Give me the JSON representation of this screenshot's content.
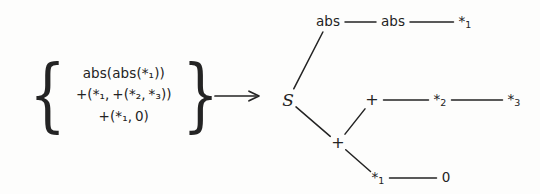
{
  "figure": {
    "background_color": "#fdfdfc",
    "ink_color": "#232323",
    "transform_arrow": "⟶"
  },
  "expression_set": {
    "open_brace": "{",
    "close_brace": "}",
    "lines": [
      {
        "id": "expr-1",
        "text": "abs(abs(*₁))"
      },
      {
        "id": "expr-2",
        "text": "+(*₁, +(*₂, *₃))"
      },
      {
        "id": "expr-3",
        "text": "+(*₁, 0)"
      }
    ]
  },
  "graph": {
    "label": "shared-subexpression-dag",
    "nodes": [
      {
        "id": "abs-top",
        "label": "abs",
        "sub": "",
        "x": 60,
        "y": 22,
        "kind": "function"
      },
      {
        "id": "abs-mid",
        "label": "abs",
        "sub": "",
        "x": 125,
        "y": 22,
        "kind": "function"
      },
      {
        "id": "star1-top",
        "label": "*",
        "sub": "1",
        "x": 197,
        "y": 22,
        "kind": "terminal"
      },
      {
        "id": "root-s",
        "label": "S",
        "sub": "",
        "x": 20,
        "y": 100,
        "kind": "root"
      },
      {
        "id": "plus-mid",
        "label": "+",
        "sub": "",
        "x": 104,
        "y": 100,
        "kind": "operator"
      },
      {
        "id": "star2",
        "label": "*",
        "sub": "2",
        "x": 172,
        "y": 100,
        "kind": "terminal"
      },
      {
        "id": "star3",
        "label": "*",
        "sub": "3",
        "x": 246,
        "y": 100,
        "kind": "terminal"
      },
      {
        "id": "plus-low",
        "label": "+",
        "sub": "",
        "x": 70,
        "y": 143,
        "kind": "operator"
      },
      {
        "id": "star1-low",
        "label": "*",
        "sub": "1",
        "x": 110,
        "y": 178,
        "kind": "terminal"
      },
      {
        "id": "zero",
        "label": "0",
        "sub": "",
        "x": 178,
        "y": 178,
        "kind": "terminal"
      }
    ],
    "edges": [
      {
        "id": "e-absTop-absMid",
        "from": "abs-top",
        "to": "abs-mid",
        "style": "solid"
      },
      {
        "id": "e-absMid-star1",
        "from": "abs-mid",
        "to": "star1-top",
        "style": "solid"
      },
      {
        "id": "e-root-absTop",
        "from": "root-s",
        "to": "abs-top",
        "style": "solid"
      },
      {
        "id": "e-root-plusLow",
        "from": "root-s",
        "to": "plus-low",
        "style": "solid"
      },
      {
        "id": "e-plusLow-plusMid",
        "from": "plus-low",
        "to": "plus-mid",
        "style": "solid"
      },
      {
        "id": "e-plusMid-star2",
        "from": "plus-mid",
        "to": "star2",
        "style": "solid"
      },
      {
        "id": "e-star2-star3",
        "from": "star2",
        "to": "star3",
        "style": "solid"
      },
      {
        "id": "e-plusLow-star1",
        "from": "plus-low",
        "to": "star1-low",
        "style": "solid"
      },
      {
        "id": "e-star1-zero",
        "from": "star1-low",
        "to": "zero",
        "style": "solid"
      }
    ]
  },
  "chart_data": {
    "type": "diagram",
    "title": "",
    "left_side": [
      "abs(abs(*1))",
      "+(*1,+(*2,*3))",
      "+(*1,0)"
    ],
    "right_side_rows": [
      [
        "abs",
        "abs",
        "*1"
      ],
      [
        "S",
        "+",
        "*2",
        "*3"
      ],
      [
        "+"
      ],
      [
        "*1",
        "0"
      ]
    ]
  }
}
